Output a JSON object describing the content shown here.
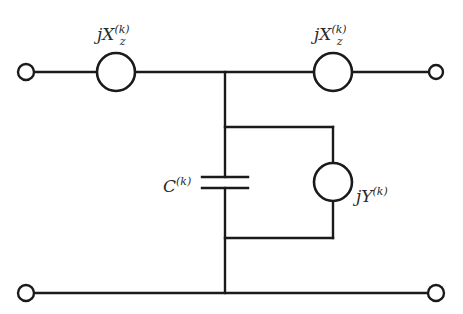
{
  "diagram": {
    "type": "circuit",
    "labels": {
      "left_series": {
        "prefix": "jX",
        "subscript": "z",
        "superscript": "(k)"
      },
      "right_series": {
        "prefix": "jX",
        "subscript": "z",
        "superscript": "(k)"
      },
      "capacitor": {
        "prefix": "C",
        "superscript": "(k)"
      },
      "shunt_admittance": {
        "prefix": "jY",
        "superscript": "(k)"
      }
    },
    "colors": {
      "line": "#1a1a1a",
      "background": "#ffffff",
      "text": "#2a2a2a"
    },
    "nodes": {
      "top_left_terminal": [
        26,
        72
      ],
      "top_right_terminal": [
        436,
        72
      ],
      "bottom_left_terminal": [
        26,
        293
      ],
      "bottom_right_terminal": [
        436,
        293
      ],
      "junction_top": [
        225,
        72
      ],
      "junction_bottom": [
        225,
        293
      ]
    },
    "components": [
      {
        "id": "left_series_element",
        "kind": "circle-element",
        "center": [
          116,
          72
        ],
        "r": 19
      },
      {
        "id": "right_series_element",
        "kind": "circle-element",
        "center": [
          333,
          72
        ],
        "r": 19
      },
      {
        "id": "capacitor",
        "kind": "capacitor",
        "x": 225,
        "plates_y": [
          177,
          188
        ],
        "plate_half_width": 23
      },
      {
        "id": "shunt_admittance",
        "kind": "circle-element",
        "center": [
          333,
          182
        ],
        "r": 19
      }
    ]
  }
}
